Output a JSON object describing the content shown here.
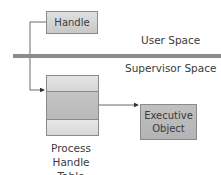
{
  "diagram": {
    "handle_label": "Handle",
    "user_space_label": "User Space",
    "supervisor_space_label": "Supervisor Space",
    "table_caption_line1": "Process Handle",
    "table_caption_line2": "Table",
    "table_rows": 3,
    "executive_object_line1": "Executive",
    "executive_object_line2": "Object",
    "colors": {
      "separator": "#8c8c8c",
      "box_fill": "#c8c8c8",
      "border": "#8a8a8a",
      "text": "#3a3a3a"
    }
  }
}
